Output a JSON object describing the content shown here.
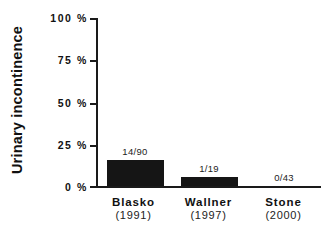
{
  "chart_data": {
    "type": "bar",
    "title": "",
    "subtitle": "",
    "xlabel": "",
    "ylabel": "Urinary incontinence",
    "ylim": [
      0,
      100
    ],
    "yticks": [
      "0 %",
      "25 %",
      "50 %",
      "75 %",
      "100 %"
    ],
    "ytick_values": [
      0,
      25,
      50,
      75,
      100
    ],
    "grid": false,
    "legend": "none",
    "categories": [
      "Blasko",
      "Wallner",
      "Stone"
    ],
    "category_years": [
      "(1991)",
      "(1997)",
      "(2000)"
    ],
    "values": [
      15.6,
      5.3,
      0
    ],
    "data_labels": [
      "14/90",
      "1/19",
      "0/43"
    ],
    "bar_color": "#151515",
    "axis_color": "#1a1a1a",
    "background_color": "#ffffff",
    "series": [
      {
        "name": "Urinary incontinence",
        "values": [
          15.6,
          5.3,
          0
        ]
      }
    ],
    "points": [
      {
        "category": "Blasko",
        "year": "(1991)",
        "label": "14/90",
        "numerator": 14,
        "denominator": 90,
        "percent": 15.6
      },
      {
        "category": "Wallner",
        "year": "(1997)",
        "label": "1/19",
        "numerator": 1,
        "denominator": 19,
        "percent": 5.3
      },
      {
        "category": "Stone",
        "year": "(2000)",
        "label": "0/43",
        "numerator": 0,
        "denominator": 43,
        "percent": 0
      }
    ]
  }
}
